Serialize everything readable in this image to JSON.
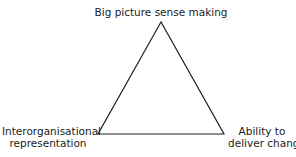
{
  "diagram": {
    "type": "triangle",
    "vertices": {
      "top": {
        "label": "Big picture sense making"
      },
      "bottom_left": {
        "label_line1": "Interorganisational",
        "label_line2": "representation"
      },
      "bottom_right": {
        "label_line1": "Ability to",
        "label_line2": "deliver change"
      }
    },
    "stroke_color": "#222222"
  }
}
